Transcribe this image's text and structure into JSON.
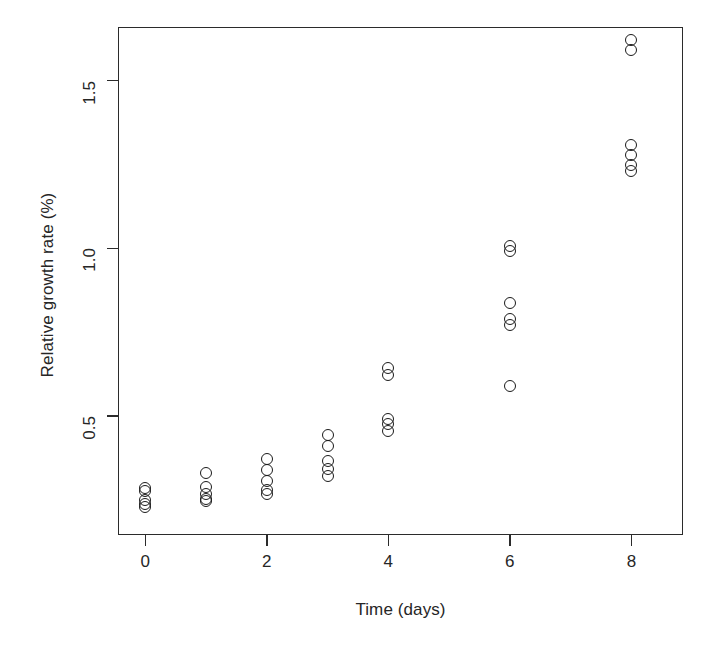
{
  "chart_data": {
    "type": "scatter",
    "title": "",
    "xlabel": "Time (days)",
    "ylabel": "Relative growth rate (%)",
    "xlim": [
      -0.45,
      8.85
    ],
    "ylim": [
      0.145,
      1.66
    ],
    "grid": false,
    "legend": null,
    "xticks": [
      0,
      2,
      4,
      6,
      8
    ],
    "xticklabels": [
      "0",
      "2",
      "4",
      "6",
      "8"
    ],
    "yticks": [
      0.5,
      1.0,
      1.5
    ],
    "yticklabels": [
      "0.5",
      "1.0",
      "1.5"
    ],
    "marker": "open-circle",
    "marker_color": "#1b1b1b",
    "points": [
      {
        "x": 0,
        "y": 0.285
      },
      {
        "x": 0,
        "y": 0.275
      },
      {
        "x": 0,
        "y": 0.25
      },
      {
        "x": 0,
        "y": 0.238
      },
      {
        "x": 0,
        "y": 0.228
      },
      {
        "x": 1,
        "y": 0.33
      },
      {
        "x": 1,
        "y": 0.288
      },
      {
        "x": 1,
        "y": 0.268
      },
      {
        "x": 1,
        "y": 0.252
      },
      {
        "x": 1,
        "y": 0.245
      },
      {
        "x": 2,
        "y": 0.372
      },
      {
        "x": 2,
        "y": 0.34
      },
      {
        "x": 2,
        "y": 0.307
      },
      {
        "x": 2,
        "y": 0.278
      },
      {
        "x": 2,
        "y": 0.268
      },
      {
        "x": 3,
        "y": 0.443
      },
      {
        "x": 3,
        "y": 0.41
      },
      {
        "x": 3,
        "y": 0.367
      },
      {
        "x": 3,
        "y": 0.343
      },
      {
        "x": 3,
        "y": 0.322
      },
      {
        "x": 4,
        "y": 0.643
      },
      {
        "x": 4,
        "y": 0.622
      },
      {
        "x": 4,
        "y": 0.492
      },
      {
        "x": 4,
        "y": 0.477
      },
      {
        "x": 4,
        "y": 0.456
      },
      {
        "x": 6,
        "y": 1.008
      },
      {
        "x": 6,
        "y": 0.992
      },
      {
        "x": 6,
        "y": 0.836
      },
      {
        "x": 6,
        "y": 0.788
      },
      {
        "x": 6,
        "y": 0.77
      },
      {
        "x": 6,
        "y": 0.588
      },
      {
        "x": 8,
        "y": 1.622
      },
      {
        "x": 8,
        "y": 1.592
      },
      {
        "x": 8,
        "y": 1.307
      },
      {
        "x": 8,
        "y": 1.277
      },
      {
        "x": 8,
        "y": 1.247
      },
      {
        "x": 8,
        "y": 1.23
      }
    ]
  },
  "axes": {
    "frame_color": "#2b2b2b"
  }
}
